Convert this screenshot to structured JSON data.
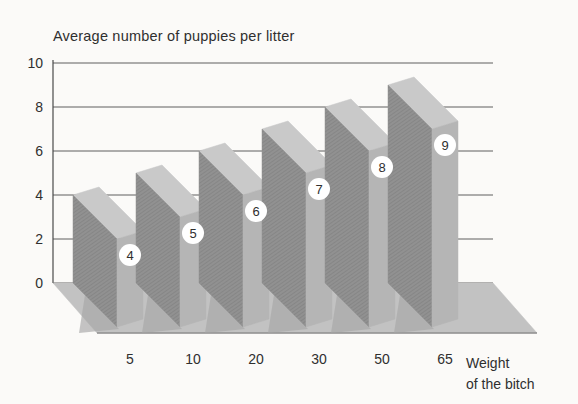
{
  "figure": {
    "kind": "scanned book figure, pseudo-3D bar chart"
  },
  "chart_data": {
    "type": "bar",
    "projection": "3d-oblique-slabs",
    "title": "Average number of puppies per litter",
    "categories": [
      "5",
      "10",
      "20",
      "30",
      "50",
      "65"
    ],
    "values": [
      4,
      5,
      6,
      7,
      8,
      9
    ],
    "bar_badges": [
      "4",
      "5",
      "6",
      "7",
      "8",
      "9"
    ],
    "xlabel_lines": [
      "Weight",
      "of the bitch"
    ],
    "ylabel": "Average number of puppies per litter",
    "ylim": [
      0,
      10
    ],
    "yticks": [
      0,
      2,
      4,
      6,
      8,
      10
    ],
    "grid": "horizontal",
    "legend": false,
    "colors": {
      "background": "#fbfaf8",
      "bar_front": "#919191",
      "bar_front_hatch": "#7b7b7b",
      "bar_side": "#b5b5b5",
      "bar_top": "#c9c9c9",
      "floor": "#c2c2c2",
      "floor_edge": "#8f8f8f",
      "floor_shadow": "#a6a6a6",
      "grid_line": "#5f5f5f",
      "axis_line": "#4a4a4a",
      "text": "#2f2f2f",
      "badge_fill": "#ffffff",
      "badge_text": "#a2a2a2"
    }
  }
}
